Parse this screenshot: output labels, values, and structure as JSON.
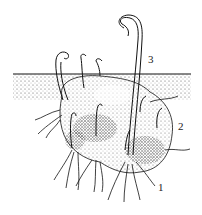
{
  "figure": {
    "labels": [
      {
        "id": "1",
        "text": "1",
        "x": 158,
        "y": 182
      },
      {
        "id": "2",
        "text": "2",
        "x": 178,
        "y": 121
      },
      {
        "id": "3",
        "text": "3",
        "x": 148,
        "y": 54
      }
    ],
    "colors": {
      "ink": "#111111",
      "background": "#ffffff",
      "stipple": "#333333"
    }
  }
}
